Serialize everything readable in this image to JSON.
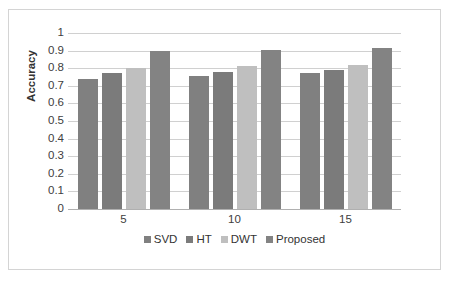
{
  "chart_data": {
    "type": "bar",
    "title": "",
    "subtitle": "",
    "xlabel": "",
    "ylabel": "Accuracy",
    "categories": [
      "5",
      "10",
      "15"
    ],
    "series": [
      {
        "name": "SVD",
        "values": [
          0.74,
          0.755,
          0.775
        ],
        "color": "#808080"
      },
      {
        "name": "HT",
        "values": [
          0.77,
          0.78,
          0.79
        ],
        "color": "#7b7b7b"
      },
      {
        "name": "DWT",
        "values": [
          0.8,
          0.815,
          0.82
        ],
        "color": "#bfbfbf"
      },
      {
        "name": "Proposed",
        "values": [
          0.895,
          0.905,
          0.915
        ],
        "color": "#838383"
      }
    ],
    "ylim": [
      0,
      1
    ],
    "ytick_step": 0.1,
    "yticks": [
      "1",
      "0.9",
      "0.8",
      "0.7",
      "0.6",
      "0.5",
      "0.4",
      "0.3",
      "0.2",
      "0.1",
      "0"
    ],
    "grid": true,
    "grid_axis": "y",
    "legend_position": "bottom",
    "legend_entries": [
      "SVD",
      "HT",
      "DWT",
      "Proposed"
    ]
  },
  "axes": {
    "y_title": "Accuracy"
  },
  "colors": {
    "frame_border": "#d4d4d4",
    "gridline": "#d0d0d0",
    "baseline": "#b0b0b0",
    "tick_text": "#404040",
    "plot_background": "#ffffff"
  }
}
